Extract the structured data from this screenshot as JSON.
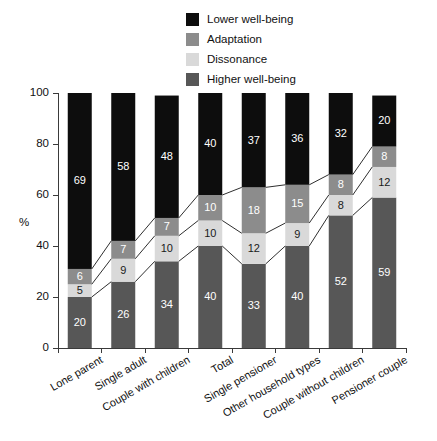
{
  "chart_data": {
    "type": "bar",
    "subtype": "stacked-100-percent-vertical",
    "title": "",
    "subtitle": "",
    "xlabel": "",
    "ylabel": "%",
    "ylim": [
      0,
      100
    ],
    "yticks": [
      0,
      20,
      40,
      60,
      80,
      100
    ],
    "ytick_labels": [
      "0",
      "20",
      "40",
      "60",
      "80",
      "100"
    ],
    "grid": false,
    "legend_position": "top-center",
    "stack_order_bottom_to_top": [
      "Higher well-being",
      "Dissonance",
      "Adaptation",
      "Lower well-being"
    ],
    "categories": [
      "Lone parent",
      "Single adult",
      "Couple with children",
      "Total",
      "Single pensioner",
      "Other household types",
      "Couple without children",
      "Pensioner couple"
    ],
    "series": [
      {
        "name": "Lower well-being",
        "color": "#0d0d0d",
        "label_color": "#ffffff",
        "values": [
          69,
          58,
          48,
          40,
          37,
          36,
          32,
          20
        ]
      },
      {
        "name": "Adaptation",
        "color": "#8c8c8c",
        "label_color": "#ffffff",
        "values": [
          6,
          7,
          7,
          10,
          18,
          15,
          8,
          8
        ]
      },
      {
        "name": "Dissonance",
        "color": "#d9d9d9",
        "label_color": "#1a1a1a",
        "values": [
          5,
          9,
          10,
          10,
          12,
          9,
          8,
          12
        ]
      },
      {
        "name": "Higher well-being",
        "color": "#575757",
        "label_color": "#ffffff",
        "values": [
          20,
          26,
          34,
          40,
          33,
          40,
          52,
          59
        ]
      }
    ],
    "connector_lines": {
      "description": "Thin lines connecting the stack boundaries between adjacent bars",
      "color": "#2f2f2f",
      "boundaries_cumulative_from_bottom": [
        [
          20,
          25,
          31
        ],
        [
          26,
          35,
          42
        ],
        [
          34,
          44,
          51
        ],
        [
          40,
          50,
          60
        ],
        [
          33,
          45,
          63
        ],
        [
          40,
          49,
          64
        ],
        [
          52,
          60,
          68
        ],
        [
          59,
          71,
          79
        ]
      ]
    }
  },
  "legend": {
    "items": [
      {
        "label": "Lower well-being",
        "color": "#0d0d0d"
      },
      {
        "label": "Adaptation",
        "color": "#8c8c8c"
      },
      {
        "label": "Dissonance",
        "color": "#d9d9d9"
      },
      {
        "label": "Higher well-being",
        "color": "#575757"
      }
    ]
  },
  "axes": {
    "y_title": "%",
    "y_tick_labels": [
      "100",
      "80",
      "60",
      "40",
      "20",
      "0"
    ],
    "x_tick_labels": [
      "Lone parent",
      "Single adult",
      "Couple with children",
      "Total",
      "Single pensioner",
      "Other household types",
      "Couple without children",
      "Pensioner couple"
    ]
  },
  "colors": {
    "lower_well_being": "#0d0d0d",
    "adaptation": "#8c8c8c",
    "dissonance": "#d9d9d9",
    "higher_well_being": "#575757",
    "axis": "#3a3a3a",
    "background": "#ffffff"
  }
}
